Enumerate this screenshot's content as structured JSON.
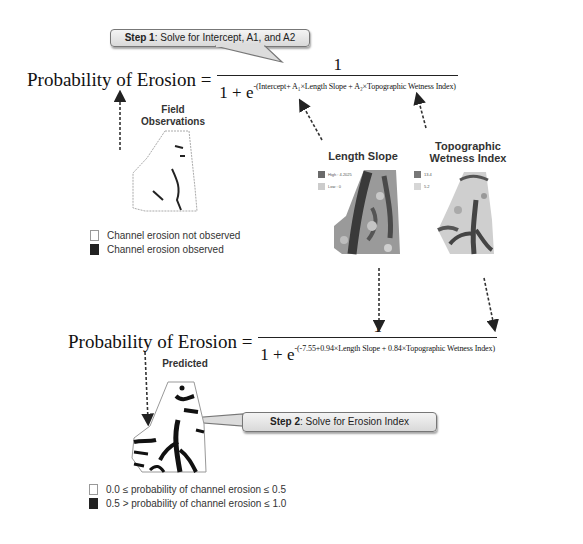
{
  "step1": {
    "prefix": "Step 1",
    "text": ": Solve for Intercept, A1, and A2"
  },
  "step2": {
    "prefix": "Step 2",
    "text": ": Solve for Erosion Index"
  },
  "equation1": {
    "lhs": "Probability of Erosion =",
    "numerator": "1",
    "denominator_base": "1 + e",
    "exponent": "-(Intercept+ A₁×Length Slope + A₂×Topographic Wetness Index)"
  },
  "equation2": {
    "lhs": "Probability of Erosion =",
    "numerator": "1",
    "denominator_base": "1 + e",
    "exponent": "-(-7.55+0.94×Length Slope + 0.84×Topographic Wetness Index)"
  },
  "panels": {
    "field_observations": {
      "title_line1": "Field",
      "title_line2": "Observations"
    },
    "length_slope": {
      "title": "Length Slope",
      "legend_high": "High : 4.2025",
      "legend_low": "Low : 0"
    },
    "twi": {
      "title_line1": "Topographic",
      "title_line2": "Wetness Index",
      "legend_high": "13.4",
      "legend_low": "5.2"
    },
    "predicted": {
      "title": "Predicted"
    }
  },
  "legend_observed": {
    "items": [
      {
        "swatch": "white",
        "label": "Channel erosion not observed"
      },
      {
        "swatch": "black",
        "label": "Channel erosion observed"
      }
    ]
  },
  "legend_predicted": {
    "items": [
      {
        "swatch": "white",
        "label": "0.0 ≤ probability of channel erosion ≤ 0.5"
      },
      {
        "swatch": "black",
        "label": "0.5 > probability of channel erosion ≤ 1.0"
      }
    ]
  }
}
